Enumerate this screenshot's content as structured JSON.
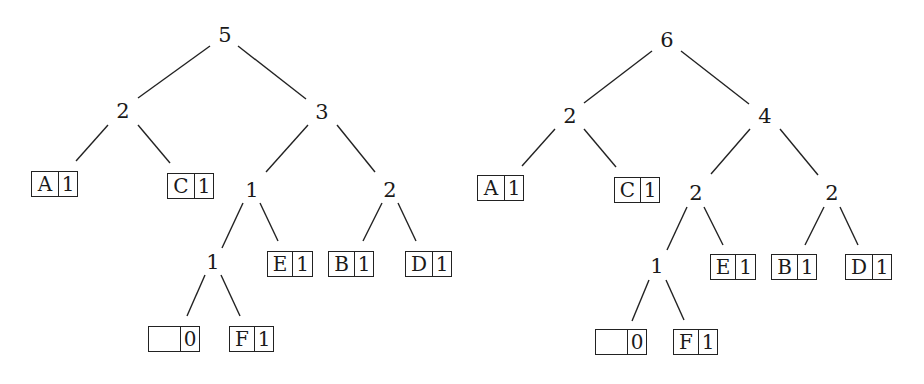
{
  "trees": [
    {
      "name": "tree-left",
      "root": "5",
      "internal_nodes": [
        {
          "id": "L_root",
          "label": "5",
          "x": 225,
          "y": 35
        },
        {
          "id": "L_2",
          "label": "2",
          "x": 123,
          "y": 111
        },
        {
          "id": "L_3",
          "label": "3",
          "x": 322,
          "y": 112
        },
        {
          "id": "L_1a",
          "label": "1",
          "x": 252,
          "y": 190
        },
        {
          "id": "L_2b",
          "label": "2",
          "x": 390,
          "y": 190
        },
        {
          "id": "L_1b",
          "label": "1",
          "x": 213,
          "y": 262
        }
      ],
      "leaves": [
        {
          "id": "L_A",
          "symbol": "A",
          "count": "1",
          "x": 31,
          "y": 171,
          "w": 47,
          "sw": 27
        },
        {
          "id": "L_C",
          "symbol": "C",
          "count": "1",
          "x": 167,
          "y": 173,
          "w": 47,
          "sw": 27
        },
        {
          "id": "L_E",
          "symbol": "E",
          "count": "1",
          "x": 267,
          "y": 251,
          "w": 46,
          "sw": 25
        },
        {
          "id": "L_B",
          "symbol": "B",
          "count": "1",
          "x": 328,
          "y": 251,
          "w": 46,
          "sw": 26
        },
        {
          "id": "L_D",
          "symbol": "D",
          "count": "1",
          "x": 405,
          "y": 251,
          "w": 47,
          "sw": 27
        },
        {
          "id": "L_empty",
          "symbol": "",
          "count": "0",
          "x": 148,
          "y": 326,
          "w": 52,
          "sw": 32
        },
        {
          "id": "L_F",
          "symbol": "F",
          "count": "1",
          "x": 229,
          "y": 326,
          "w": 45,
          "sw": 25
        }
      ],
      "edges": [
        [
          210,
          46,
          138,
          98
        ],
        [
          238,
          46,
          306,
          99
        ],
        [
          108,
          125,
          76,
          161
        ],
        [
          138,
          125,
          170,
          163
        ],
        [
          308,
          125,
          266,
          172
        ],
        [
          337,
          125,
          375,
          172
        ],
        [
          243,
          203,
          222,
          248
        ],
        [
          260,
          203,
          278,
          241
        ],
        [
          382,
          203,
          363,
          241
        ],
        [
          398,
          203,
          416,
          241
        ],
        [
          205,
          275,
          187,
          316
        ],
        [
          221,
          275,
          240,
          316
        ]
      ]
    },
    {
      "name": "tree-right",
      "root": "6",
      "internal_nodes": [
        {
          "id": "R_root",
          "label": "6",
          "x": 667,
          "y": 40
        },
        {
          "id": "R_2",
          "label": "2",
          "x": 570,
          "y": 116
        },
        {
          "id": "R_4",
          "label": "4",
          "x": 765,
          "y": 116
        },
        {
          "id": "R_2a",
          "label": "2",
          "x": 696,
          "y": 193
        },
        {
          "id": "R_2b",
          "label": "2",
          "x": 832,
          "y": 193
        },
        {
          "id": "R_1",
          "label": "1",
          "x": 657,
          "y": 266
        }
      ],
      "leaves": [
        {
          "id": "R_A",
          "symbol": "A",
          "count": "1",
          "x": 477,
          "y": 175,
          "w": 47,
          "sw": 27
        },
        {
          "id": "R_C",
          "symbol": "C",
          "count": "1",
          "x": 614,
          "y": 177,
          "w": 46,
          "sw": 26
        },
        {
          "id": "R_E",
          "symbol": "E",
          "count": "1",
          "x": 710,
          "y": 254,
          "w": 46,
          "sw": 25
        },
        {
          "id": "R_B",
          "symbol": "B",
          "count": "1",
          "x": 771,
          "y": 254,
          "w": 46,
          "sw": 26
        },
        {
          "id": "R_D",
          "symbol": "D",
          "count": "1",
          "x": 845,
          "y": 254,
          "w": 47,
          "sw": 27
        },
        {
          "id": "R_empty",
          "symbol": "",
          "count": "0",
          "x": 595,
          "y": 329,
          "w": 52,
          "sw": 32
        },
        {
          "id": "R_F",
          "symbol": "F",
          "count": "1",
          "x": 673,
          "y": 329,
          "w": 45,
          "sw": 25
        }
      ],
      "edges": [
        [
          652,
          51,
          584,
          103
        ],
        [
          681,
          51,
          749,
          104
        ],
        [
          555,
          129,
          522,
          166
        ],
        [
          584,
          129,
          616,
          167
        ],
        [
          750,
          129,
          711,
          174
        ],
        [
          780,
          129,
          818,
          175
        ],
        [
          687,
          207,
          667,
          250
        ],
        [
          704,
          207,
          723,
          245
        ],
        [
          824,
          207,
          805,
          245
        ],
        [
          840,
          207,
          858,
          245
        ],
        [
          649,
          280,
          632,
          321
        ],
        [
          666,
          280,
          684,
          320
        ]
      ]
    }
  ]
}
